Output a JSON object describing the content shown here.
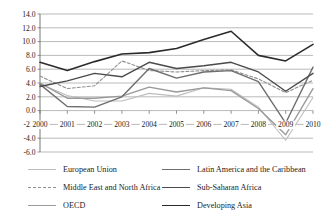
{
  "chart_data": {
    "type": "line",
    "title": "",
    "subtitle": "",
    "xlabel": "",
    "ylabel": "",
    "x": [
      2000,
      2001,
      2002,
      2003,
      2004,
      2005,
      2006,
      2007,
      2008,
      2009,
      2010
    ],
    "xtick_labels": [
      "2000",
      "2001",
      "2002",
      "2003",
      "2004",
      "2005",
      "2006",
      "2007",
      "2008",
      "2009",
      "2010"
    ],
    "ytick_labels": [
      "14.0",
      "12.0",
      "10.0",
      "8.0",
      "6.0",
      "4.0",
      "2.0",
      "0.0",
      "-2.0",
      "-4.0",
      "-6.0"
    ],
    "ytick_values": [
      14.0,
      12.0,
      10.0,
      8.0,
      6.0,
      4.0,
      2.0,
      0.0,
      -2.0,
      -4.0,
      -6.0
    ],
    "ylim": [
      -6.0,
      14.0
    ],
    "xlim": [
      2000,
      2010
    ],
    "grid": true,
    "legend_position": "bottom",
    "legend_columns": 2,
    "series": [
      {
        "name": "European Union",
        "color": "#bdbdbd",
        "style": "solid",
        "width": 1.1,
        "values": [
          3.9,
          2.2,
          1.4,
          1.4,
          2.5,
          2.1,
          3.3,
          3.1,
          0.5,
          -4.3,
          1.9
        ]
      },
      {
        "name": "Middle East and North Africa",
        "color": "#8f8f8f",
        "style": "dashed",
        "width": 1.1,
        "values": [
          5.0,
          3.2,
          3.6,
          7.2,
          5.8,
          5.6,
          5.8,
          5.9,
          4.6,
          2.6,
          4.4
        ]
      },
      {
        "name": "OECD",
        "color": "#9a9a9a",
        "style": "solid",
        "width": 1.4,
        "values": [
          4.0,
          1.8,
          1.8,
          2.1,
          3.4,
          2.7,
          3.3,
          2.9,
          0.3,
          -3.5,
          3.2
        ]
      },
      {
        "name": "Latin America and the Caribbean",
        "color": "#6e6e6e",
        "style": "solid",
        "width": 1.4,
        "values": [
          3.8,
          0.6,
          0.5,
          2.0,
          6.1,
          4.7,
          5.6,
          5.8,
          4.2,
          -1.8,
          6.3
        ]
      },
      {
        "name": "Sub-Saharan Africa",
        "color": "#4a4a4a",
        "style": "solid",
        "width": 1.4,
        "values": [
          3.5,
          4.3,
          5.4,
          4.9,
          7.0,
          6.1,
          6.5,
          7.0,
          5.6,
          2.8,
          5.4
        ]
      },
      {
        "name": "Developing Asia",
        "color": "#2b2b2b",
        "style": "solid",
        "width": 1.6,
        "values": [
          7.0,
          5.8,
          7.1,
          8.2,
          8.4,
          9.0,
          10.3,
          11.5,
          8.0,
          7.2,
          9.6
        ]
      }
    ]
  },
  "legend": {
    "items": [
      {
        "label": "European Union",
        "series_index": 0
      },
      {
        "label": "Latin America and the Caribbean",
        "series_index": 3
      },
      {
        "label": "Middle East and North Africa",
        "series_index": 1
      },
      {
        "label": "Sub-Saharan Africa",
        "series_index": 4
      },
      {
        "label": "OECD",
        "series_index": 2
      },
      {
        "label": "Developing Asia",
        "series_index": 5
      }
    ]
  },
  "colors": {
    "grid": "#8a8a8a",
    "axis": "#555555",
    "text": "#1c1c1c",
    "background": "#ffffff"
  }
}
